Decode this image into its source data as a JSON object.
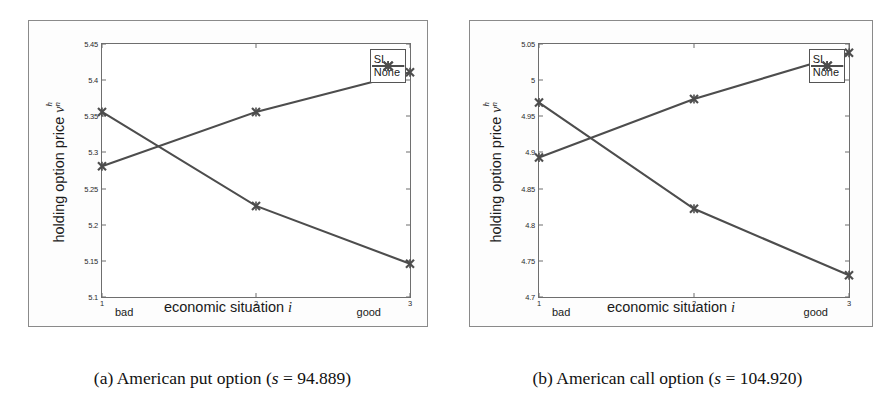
{
  "figure": {
    "panels": [
      {
        "id": "panel-a",
        "caption_prefix": "(a) American put option (",
        "caption_math_s": "s",
        "caption_eq": " = 94.889)",
        "caption_full": "(a) American put option (s = 94.889)",
        "ylabel_text": "holding option price ",
        "ylabel_symbol": "v",
        "ylabel_sup": "h",
        "ylabel_sub": "n",
        "xlabel_text": "economic situation ",
        "xlabel_symbol": "i",
        "left_end_label": "bad",
        "right_end_label": "good",
        "legend": [
          "SI",
          "None"
        ]
      },
      {
        "id": "panel-b",
        "caption_prefix": "(b) American call option (",
        "caption_math_s": "s",
        "caption_eq": " = 104.920)",
        "caption_full": "(b) American call option (s = 104.920)",
        "ylabel_text": "holding option price ",
        "ylabel_symbol": "v",
        "ylabel_sup": "h",
        "ylabel_sub": "n",
        "xlabel_text": "economic situation ",
        "xlabel_symbol": "i",
        "left_end_label": "bad",
        "right_end_label": "good",
        "legend": [
          "SI",
          "None"
        ]
      }
    ],
    "colors": {
      "line": "#4d4d4d",
      "axis": "#6e6e6e",
      "frame": "#8a8a8a",
      "text": "#1a1a1a",
      "background": "#ffffff"
    }
  },
  "chart_data": [
    {
      "type": "line",
      "title": "(a) American put option (s = 94.889)",
      "xlabel": "economic situation i",
      "ylabel": "holding option price v_n^h",
      "x": [
        1,
        2,
        3
      ],
      "xticklabels": [
        "1",
        "2",
        "3"
      ],
      "xlim": [
        1,
        3
      ],
      "x_axis_annotations": {
        "left": "bad",
        "right": "good"
      },
      "ylim": [
        5.1,
        5.45
      ],
      "yticks": [
        5.1,
        5.15,
        5.2,
        5.25,
        5.3,
        5.35,
        5.4,
        5.45
      ],
      "yticklabels": [
        "5.1",
        "5.15",
        "5.2",
        "5.25",
        "5.3",
        "5.35",
        "5.4",
        "5.45"
      ],
      "grid": false,
      "legend_position": "upper right",
      "marker": "x",
      "series": [
        {
          "name": "SI",
          "values": [
            5.281,
            5.356,
            5.411
          ]
        },
        {
          "name": "None",
          "values": [
            5.356,
            5.226,
            5.146
          ]
        }
      ]
    },
    {
      "type": "line",
      "title": "(b) American call option (s = 104.920)",
      "xlabel": "economic situation i",
      "ylabel": "holding option price v_n^h",
      "x": [
        1,
        2,
        3
      ],
      "xticklabels": [
        "1",
        "2",
        "3"
      ],
      "xlim": [
        1,
        3
      ],
      "x_axis_annotations": {
        "left": "bad",
        "right": "good"
      },
      "ylim": [
        4.7,
        5.05
      ],
      "yticks": [
        4.7,
        4.75,
        4.8,
        4.85,
        4.9,
        4.95,
        5.0,
        5.05
      ],
      "yticklabels": [
        "4.7",
        "4.75",
        "4.8",
        "4.85",
        "4.9",
        "4.95",
        "5",
        "5.05"
      ],
      "grid": false,
      "legend_position": "upper right",
      "marker": "x",
      "series": [
        {
          "name": "SI",
          "values": [
            4.893,
            4.974,
            5.038
          ]
        },
        {
          "name": "None",
          "values": [
            4.969,
            4.822,
            4.73
          ]
        }
      ]
    }
  ]
}
